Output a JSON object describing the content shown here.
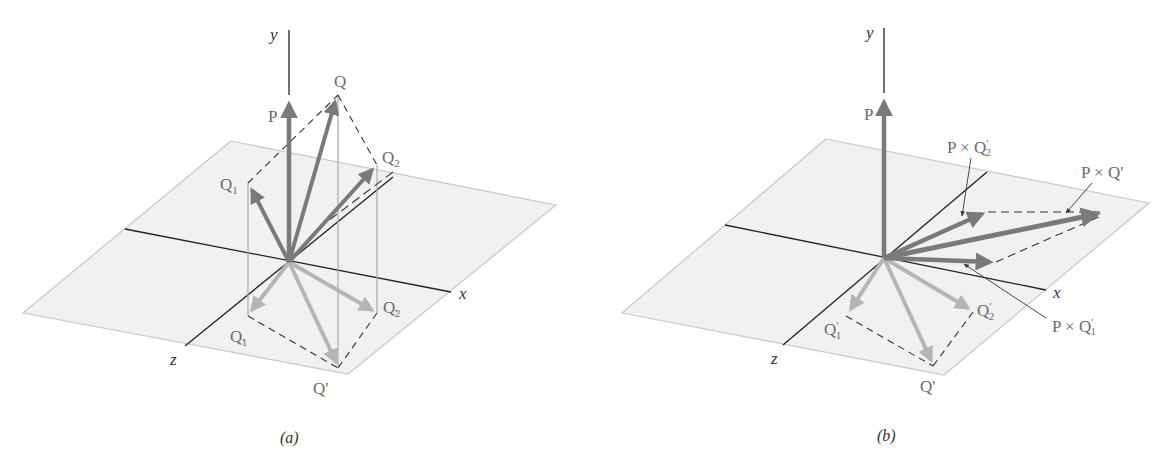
{
  "figure": {
    "panels": [
      {
        "id": "a",
        "caption": "(a)",
        "axes": {
          "y": "y",
          "x": "x",
          "z": "z"
        },
        "labels": {
          "P": "P",
          "Q": "Q",
          "Q1": "Q",
          "Q1_sub": "1",
          "Q2": "Q",
          "Q2_sub": "2",
          "Q1p": "Q",
          "Q1p_sub": "1",
          "Q2p": "Q",
          "Q2p_sub": "2",
          "Qp": "Q'"
        }
      },
      {
        "id": "b",
        "caption": "(b)",
        "axes": {
          "y": "y",
          "x": "x",
          "z": "z"
        },
        "labels": {
          "P": "P",
          "PxQ2p": "P × Q",
          "PxQ2p_sub": "2",
          "PxQp": "P × Q'",
          "PxQ1p": "P × Q",
          "PxQ1p_sub": "1",
          "Q1p": "Q",
          "Q1p_sub": "1",
          "Q2p": "Q",
          "Q2p_sub": "2",
          "Qp": "Q'"
        }
      }
    ],
    "colors": {
      "plane_fill": "#f1f1f1",
      "plane_edge": "#c8c8c8",
      "axis": "#222222",
      "vector_dark": "#7a7a7a",
      "vector_light": "#b5b5b5",
      "dashed": "#333333",
      "label": "#6b6b6b"
    }
  }
}
